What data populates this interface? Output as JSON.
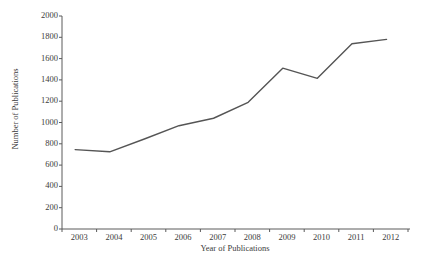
{
  "chart_data": {
    "type": "line",
    "title": "",
    "xlabel": "Year of Publications",
    "ylabel": "Number of Publications",
    "categories": [
      "2003",
      "2004",
      "2005",
      "2006",
      "2007",
      "2008",
      "2009",
      "2010",
      "2011",
      "2012"
    ],
    "values": [
      745,
      725,
      845,
      970,
      1040,
      1190,
      1510,
      1415,
      1740,
      1780
    ],
    "x": [
      2003,
      2004,
      2005,
      2006,
      2007,
      2008,
      2009,
      2010,
      2011,
      2012
    ],
    "ylim": [
      0,
      2000
    ],
    "ytick_labels": [
      "2000",
      "1800",
      "1600",
      "1400",
      "1200",
      "1000",
      "800",
      "600",
      "400",
      "200",
      "0"
    ],
    "ytick_values": [
      2000,
      1800,
      1600,
      1400,
      1200,
      1000,
      800,
      600,
      400,
      200,
      0
    ],
    "xtick_labels": [
      "2003",
      "2004",
      "2005",
      "2006",
      "2007",
      "2008",
      "2009",
      "2010",
      "2011",
      "2012"
    ],
    "grid": false,
    "legend": false,
    "series": [
      {
        "name": "Number of Publications",
        "values": [
          745,
          725,
          845,
          970,
          1040,
          1190,
          1510,
          1415,
          1740,
          1780
        ],
        "color": "#555555"
      }
    ],
    "colors": {
      "line": "#555555",
      "axis": "#5a5a5a",
      "text": "#3b3b3b",
      "background": "#ffffff"
    }
  }
}
